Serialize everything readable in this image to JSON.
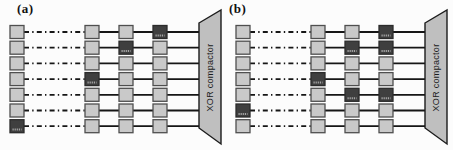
{
  "figure": {
    "panels": [
      {
        "label": "(a)",
        "compactor_label": "XOR compactor",
        "scan_chain_count": 7,
        "rows": [
          {
            "left": "light",
            "cells": [
              "light",
              "light",
              "dark"
            ]
          },
          {
            "left": "light",
            "cells": [
              "light",
              "dark",
              "light"
            ]
          },
          {
            "left": "light",
            "cells": [
              "light",
              "light",
              "light"
            ]
          },
          {
            "left": "light",
            "cells": [
              "dark",
              "light",
              "light"
            ]
          },
          {
            "left": "light",
            "cells": [
              "light",
              "light",
              "light"
            ]
          },
          {
            "left": "light",
            "cells": [
              "light",
              "light",
              "light"
            ]
          },
          {
            "left": "dark",
            "cells": [
              "light",
              "light",
              "light"
            ]
          }
        ]
      },
      {
        "label": "(b)",
        "compactor_label": "XOR compactor",
        "scan_chain_count": 7,
        "rows": [
          {
            "left": "light",
            "cells": [
              "light",
              "light",
              "dark"
            ]
          },
          {
            "left": "light",
            "cells": [
              "light",
              "dark",
              "dark"
            ]
          },
          {
            "left": "light",
            "cells": [
              "light",
              "light",
              "light"
            ]
          },
          {
            "left": "light",
            "cells": [
              "dark",
              "light",
              "light"
            ]
          },
          {
            "left": "light",
            "cells": [
              "light",
              "dark",
              "dark"
            ]
          },
          {
            "left": "dark",
            "cells": [
              "light",
              "light",
              "light"
            ]
          },
          {
            "left": "light",
            "cells": [
              "light",
              "light",
              "light"
            ]
          }
        ]
      }
    ],
    "colors": {
      "background": "#fcfcfc",
      "cell_light": "#c9c9c9",
      "cell_border": "#4f4f4f",
      "cell_dark": "#3f3f3f",
      "cell_dark_border": "#2b2b2b",
      "dark_cell_mark": "#a5a5a5",
      "wire": "#161616",
      "compactor_fill": "#bfbfbf",
      "compactor_border": "#1c1c1c"
    }
  }
}
